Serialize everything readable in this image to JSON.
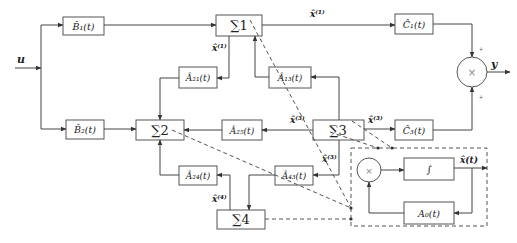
{
  "diagram": {
    "title": "",
    "input": {
      "label": "u"
    },
    "output": {
      "label": "y"
    },
    "blocks": {
      "B1": {
        "label": "B̂₁(t)"
      },
      "B2": {
        "label": "B̂₂(t)"
      },
      "S1": {
        "label": "∑1"
      },
      "S2": {
        "label": "∑2"
      },
      "S3": {
        "label": "∑3"
      },
      "S4": {
        "label": "∑4"
      },
      "A21": {
        "label": "Â₂₁(t)"
      },
      "A13": {
        "label": "Â₁₃(t)"
      },
      "A25": {
        "label": "Â₂₅(t)"
      },
      "A24": {
        "label": "Â₂₄(t)"
      },
      "A43": {
        "label": "Â₄₃(t)"
      },
      "C1": {
        "label": "Ĉ₁(t)"
      },
      "C3": {
        "label": "Ĉ₃(t)"
      },
      "mult_out": {
        "label": "×"
      },
      "mult_in": {
        "label": "×"
      },
      "integrator": {
        "label": "∫"
      },
      "A0": {
        "label": "A₀(t)"
      }
    },
    "signals": {
      "x1_top": "x̂⁽¹⁾",
      "x1_down": "x̂⁽¹⁾",
      "x3_left": "x̂⁽³⁾",
      "x3_right": "x̂⁽³⁾",
      "x3_down": "x̂⁽³⁾",
      "x4": "x̂⁽⁴⁾",
      "x_inner": "x̂(t)",
      "plus_top": "+",
      "plus_bottom": "+"
    }
  }
}
